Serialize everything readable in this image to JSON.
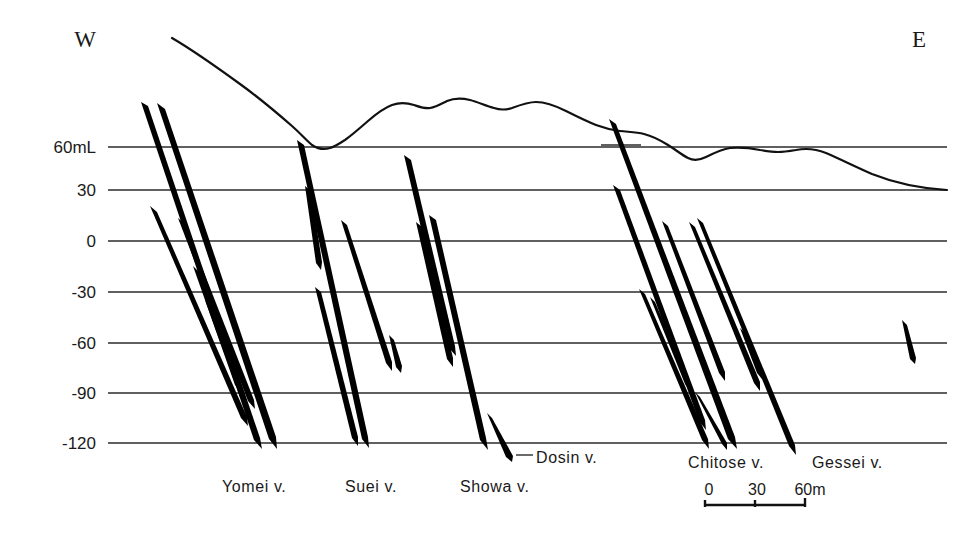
{
  "figure": {
    "type": "geological-cross-section",
    "orientation_left": "W",
    "orientation_right": "E"
  },
  "axis": {
    "unit_note": "60mL",
    "labels": [
      "60mL",
      "30",
      "0",
      "-30",
      "-60",
      "-90",
      "-120"
    ],
    "values": [
      60,
      30,
      0,
      -30,
      -60,
      -90,
      -120
    ],
    "ylabel": "",
    "grid": true
  },
  "veins": [
    {
      "name": "Yomei v.",
      "label": "Yomei v."
    },
    {
      "name": "Suei v.",
      "label": "Suei v."
    },
    {
      "name": "Showa v.",
      "label": "Showa v."
    },
    {
      "name": "Dosin v.",
      "label": "Dosin v."
    },
    {
      "name": "Chitose v.",
      "label": "Chitose v."
    },
    {
      "name": "Gessei v.",
      "label": "Gessei v."
    }
  ],
  "scale": {
    "ticks": [
      "0",
      "30",
      "60m"
    ],
    "values": [
      0,
      30,
      60
    ],
    "unit": "m"
  },
  "colors": {
    "ink": "#111111",
    "grid": "#2b2b2b",
    "background": "#ffffff"
  }
}
